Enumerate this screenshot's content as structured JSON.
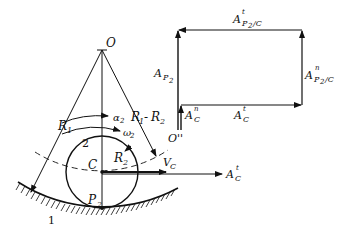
{
  "figure": {
    "left": {
      "center_label": "O",
      "wheel_center_label": "C",
      "contact_point_label": "P",
      "contact_point_sub": "2",
      "ground_label": "1",
      "wheel_label": "2",
      "R1": {
        "main": "R",
        "sub": "1"
      },
      "R2": {
        "main": "R",
        "sub": "2"
      },
      "R1_minus_R2": {
        "a": "R",
        "a_sub": "1",
        "minus": "-",
        "b": "R",
        "b_sub": "2"
      },
      "alpha": {
        "main": "α",
        "sub": "2"
      },
      "omega": {
        "main": "ω",
        "sub": "2"
      },
      "VC": {
        "main": "V",
        "sub": "C"
      },
      "ACt": {
        "main": "A",
        "sup": "t",
        "sub": "C"
      }
    },
    "polygon": {
      "origin_label": "O''",
      "AP2": {
        "main": "A",
        "sub": "P",
        "subsub": "2"
      },
      "ACn": {
        "main": "A",
        "sup": "n",
        "sub": "C"
      },
      "ACt": {
        "main": "A",
        "sup": "t",
        "sub": "C"
      },
      "AP2C_n": {
        "main": "A",
        "sup": "n",
        "sub": "P",
        "subsub": "2",
        "tail": "/C"
      },
      "AP2C_t": {
        "main": "A",
        "sup": "t",
        "sub": "P",
        "subsub": "2",
        "tail": "/C"
      }
    }
  }
}
